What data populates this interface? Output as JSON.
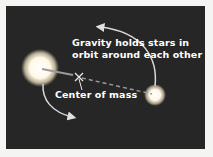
{
  "diagram": {
    "title_lines": [
      "Gravity holds stars in",
      "orbit around each other"
    ],
    "center_label": "Center of mass",
    "colors": {
      "background": "#262626",
      "page": "#f4f4f2",
      "text": "#ffffff",
      "star": "#fffbe8",
      "arrow": "#d8d8d8"
    },
    "elements": [
      "large-star",
      "small-star",
      "center-of-mass-marker",
      "orbit-arrow-top",
      "orbit-arrow-bottom"
    ]
  }
}
